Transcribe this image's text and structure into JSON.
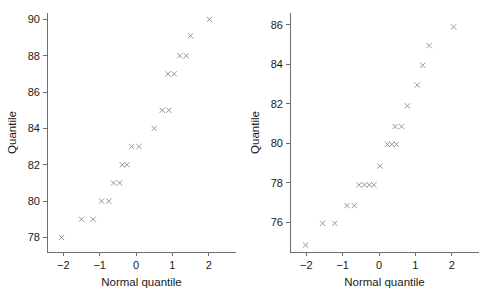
{
  "figure": {
    "panel_count": 2
  },
  "chart_data": [
    {
      "type": "scatter",
      "title": "",
      "xlabel": "Normal quantile",
      "ylabel": "Quantile",
      "xlim": [
        -2.45,
        2.75
      ],
      "ylim": [
        77.2,
        90.35
      ],
      "xticks": [
        -2,
        -1,
        0,
        1,
        2
      ],
      "xticklabels": [
        "−2",
        "−1",
        "0",
        "1",
        "2"
      ],
      "yticks": [
        78,
        80,
        82,
        84,
        86,
        88,
        90
      ],
      "yticklabels": [
        "78",
        "80",
        "82",
        "84",
        "86",
        "88",
        "90"
      ],
      "grid": false,
      "legend": "none",
      "marker": "x",
      "marker_color": "#8a8a92",
      "points": [
        {
          "x": -2.05,
          "y": 78.0
        },
        {
          "x": -1.5,
          "y": 79.0
        },
        {
          "x": -1.18,
          "y": 79.0
        },
        {
          "x": -0.95,
          "y": 80.0
        },
        {
          "x": -0.75,
          "y": 80.0
        },
        {
          "x": -0.62,
          "y": 81.0
        },
        {
          "x": -0.45,
          "y": 81.0
        },
        {
          "x": -0.38,
          "y": 82.0
        },
        {
          "x": -0.25,
          "y": 82.0
        },
        {
          "x": -0.12,
          "y": 83.0
        },
        {
          "x": 0.08,
          "y": 83.0
        },
        {
          "x": 0.5,
          "y": 84.0
        },
        {
          "x": 0.72,
          "y": 85.0
        },
        {
          "x": 0.9,
          "y": 85.0
        },
        {
          "x": 0.88,
          "y": 87.0
        },
        {
          "x": 1.05,
          "y": 87.0
        },
        {
          "x": 1.2,
          "y": 88.0
        },
        {
          "x": 1.38,
          "y": 88.0
        },
        {
          "x": 1.5,
          "y": 89.1
        },
        {
          "x": 2.02,
          "y": 90.0
        }
      ]
    },
    {
      "type": "scatter",
      "title": "",
      "xlabel": "Normal quantile",
      "ylabel": "Quantile",
      "xlim": [
        -2.45,
        2.75
      ],
      "ylim": [
        74.5,
        86.6
      ],
      "xticks": [
        -2,
        -1,
        0,
        1,
        2
      ],
      "xticklabels": [
        "−2",
        "−1",
        "0",
        "1",
        "2"
      ],
      "yticks": [
        76,
        78,
        80,
        82,
        84,
        86
      ],
      "yticklabels": [
        "76",
        "78",
        "80",
        "82",
        "84",
        "86"
      ],
      "grid": false,
      "legend": "none",
      "marker": "x",
      "marker_color": "#8a8a92",
      "points": [
        {
          "x": -2.02,
          "y": 74.85
        },
        {
          "x": -1.55,
          "y": 75.95
        },
        {
          "x": -1.22,
          "y": 75.95
        },
        {
          "x": -0.88,
          "y": 76.85
        },
        {
          "x": -0.68,
          "y": 76.85
        },
        {
          "x": -0.55,
          "y": 77.9
        },
        {
          "x": -0.4,
          "y": 77.9
        },
        {
          "x": -0.27,
          "y": 77.9
        },
        {
          "x": -0.14,
          "y": 77.9
        },
        {
          "x": 0.02,
          "y": 78.85
        },
        {
          "x": 0.23,
          "y": 79.95
        },
        {
          "x": 0.35,
          "y": 79.95
        },
        {
          "x": 0.48,
          "y": 79.95
        },
        {
          "x": 0.44,
          "y": 80.85
        },
        {
          "x": 0.62,
          "y": 80.85
        },
        {
          "x": 0.78,
          "y": 81.9
        },
        {
          "x": 1.05,
          "y": 82.95
        },
        {
          "x": 1.2,
          "y": 83.95
        },
        {
          "x": 1.38,
          "y": 84.95
        },
        {
          "x": 2.05,
          "y": 85.9
        }
      ]
    }
  ]
}
